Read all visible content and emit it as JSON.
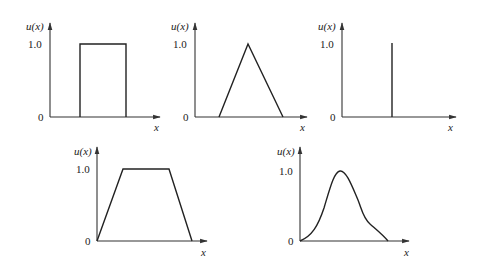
{
  "figure": {
    "axis_labels": {
      "y": "u(x)",
      "x": "x",
      "y_tick_top": "1.0",
      "y_tick_zero": "0"
    },
    "panels": [
      {
        "name": "rectangular",
        "ylabel": "u(x)",
        "xlabel": "x",
        "tick_top": "1.0",
        "tick_zero": "0"
      },
      {
        "name": "triangular",
        "ylabel": "u(x)",
        "xlabel": "x",
        "tick_top": "1.0",
        "tick_zero": "0"
      },
      {
        "name": "singleton",
        "ylabel": "u(x)",
        "xlabel": "x",
        "tick_top": "1.0",
        "tick_zero": "0"
      },
      {
        "name": "trapezoidal",
        "ylabel": "u(x)",
        "xlabel": "x",
        "tick_top": "1.0",
        "tick_zero": "0"
      },
      {
        "name": "bell-shaped",
        "ylabel": "u(x)",
        "xlabel": "x",
        "tick_top": "1.0",
        "tick_zero": "0"
      }
    ]
  },
  "colors": {
    "line": "#222222",
    "axis": "#333333",
    "background": "#ffffff"
  }
}
